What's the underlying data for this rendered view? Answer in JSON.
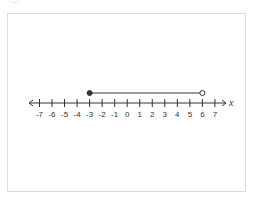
{
  "diagram": {
    "type": "number_line",
    "variable_label": "x",
    "min": -7,
    "max": 7,
    "ticks": [
      -7,
      -6,
      -5,
      -4,
      -3,
      -2,
      -1,
      0,
      1,
      2,
      3,
      4,
      5,
      6,
      7
    ],
    "tick_labels": [
      "-7",
      "-6",
      "-5",
      "-4",
      "-3",
      "-2",
      "-1",
      "0",
      "1",
      "2",
      "3",
      "4",
      "5",
      "6",
      "7"
    ],
    "interval": {
      "start": -3,
      "end": 6,
      "start_closed": true,
      "end_closed": false,
      "notation": "[-3, 6)"
    },
    "colors": {
      "line": "#333333",
      "frame": "#dcdcdc"
    }
  }
}
